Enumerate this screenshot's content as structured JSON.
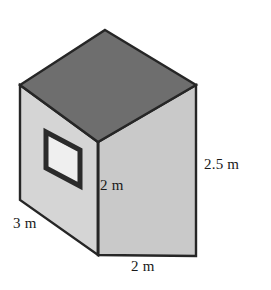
{
  "figure": {
    "name": "rectangular-prism-with-window",
    "colors": {
      "background": "#ffffff",
      "top_face": "#6e6e6e",
      "front_face": "#c9c9c9",
      "left_face": "#d5d5d5",
      "outline": "#262626",
      "window_frame": "#2b2b2b",
      "window_glass": "#eeeeee",
      "text": "#1a1a1a"
    },
    "faces": [
      {
        "id": "top-face",
        "shade": "dark",
        "points": "105,30 196,85 98,142 20,85"
      },
      {
        "id": "left-face",
        "shade": "light",
        "points": "20,85 98,142 98,255 20,200"
      },
      {
        "id": "front-face",
        "shade": "medium",
        "points": "98,142 196,85 196,256 98,255"
      }
    ],
    "window": {
      "id": "side-window",
      "points": "46,132 80,150 80,186 46,168"
    }
  },
  "labels": {
    "depth": "3 m",
    "front_height": "2 m",
    "side_height": "2.5 m",
    "width": "2 m"
  }
}
